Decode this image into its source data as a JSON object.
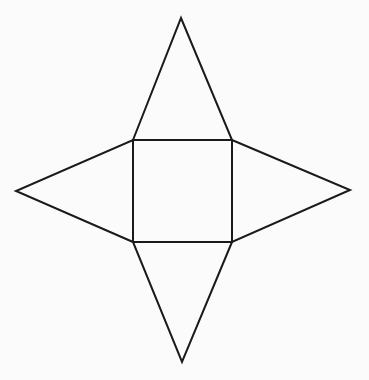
{
  "diagram": {
    "title": "",
    "shape": "square-pyramid-net",
    "base": {
      "label": "",
      "edge_style": "dashed"
    },
    "faces": [
      {
        "id": "top",
        "label": ""
      },
      {
        "id": "right",
        "label": ""
      },
      {
        "id": "bottom",
        "label": ""
      },
      {
        "id": "left",
        "label": ""
      }
    ],
    "colors": {
      "line": "#1a1a1a",
      "background": "#fbfbfb"
    }
  }
}
